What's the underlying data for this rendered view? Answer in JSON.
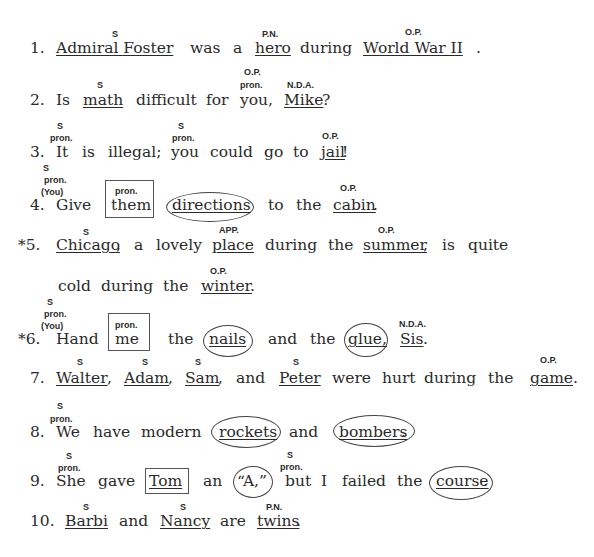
{
  "sentences": [
    {
      "num": "1.",
      "words": [
        "Admiral Foster",
        "was",
        "a",
        "hero",
        "during",
        "World War II",
        "."
      ],
      "labels": [
        "S",
        "P.N.",
        "O.P."
      ]
    },
    {
      "num": "2.",
      "words": [
        "Is",
        "math",
        "difficult",
        "for",
        "you,",
        "Mike",
        "?"
      ],
      "labels": [
        "S",
        "O.P.",
        "pron.",
        "N.D.A."
      ]
    },
    {
      "num": "3.",
      "words": [
        "It",
        "is",
        "illegal;",
        "you",
        "could",
        "go",
        "to",
        "jail",
        "!"
      ],
      "labels": [
        "S",
        "pron.",
        "S",
        "pron.",
        "O.P."
      ]
    },
    {
      "num": "4.",
      "words": [
        "Give",
        "them",
        "directions",
        "to",
        "the",
        "cabin",
        "."
      ],
      "labels": [
        "S",
        "pron.",
        "(You)",
        "pron.",
        "O.P."
      ]
    },
    {
      "num": "*5.",
      "words": [
        "Chicago",
        ",",
        "a",
        "lovely",
        "place",
        "during",
        "the",
        "summer",
        ",",
        "is",
        "quite",
        "cold",
        "during",
        "the",
        "winter",
        "."
      ],
      "labels": [
        "S",
        "APP.",
        "O.P.",
        "O.P."
      ]
    },
    {
      "num": "*6.",
      "words": [
        "Hand",
        "me",
        "the",
        "nails",
        "and",
        "the",
        "glue,",
        "Sis",
        "."
      ],
      "labels": [
        "S",
        "pron.",
        "(You)",
        "pron.",
        "N.D.A."
      ]
    },
    {
      "num": "7.",
      "words": [
        "Walter",
        ",",
        "Adam",
        ",",
        "Sam",
        ",",
        "and",
        "Peter",
        "were",
        "hurt",
        "during",
        "the",
        "game",
        "."
      ],
      "labels": [
        "S",
        "S",
        "S",
        "S",
        "O.P."
      ]
    },
    {
      "num": "8.",
      "words": [
        "We",
        "have",
        "modern",
        "rockets",
        "and",
        "bombers",
        "."
      ],
      "labels": [
        "S",
        "pron."
      ]
    },
    {
      "num": "9.",
      "words": [
        "She",
        "gave",
        "Tom",
        "an",
        "“A,”",
        "but",
        "I",
        "failed",
        "the",
        "course",
        "."
      ],
      "labels": [
        "S",
        "pron.",
        "S",
        "pron."
      ]
    },
    {
      "num": "10.",
      "words": [
        "Barbi",
        "and",
        "Nancy",
        "are",
        "twins",
        "."
      ],
      "labels": [
        "S",
        "S",
        "P.N."
      ]
    }
  ]
}
